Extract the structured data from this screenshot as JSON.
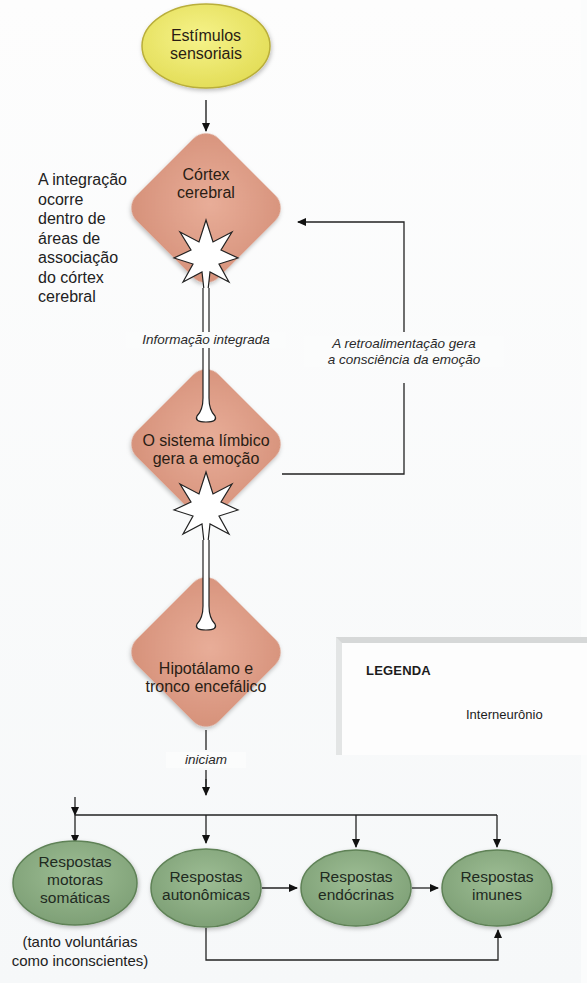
{
  "nodes": {
    "stimuli": {
      "label_line1": "Estímulos",
      "label_line2": "sensoriais",
      "color": "#ede96a"
    },
    "cortex": {
      "label_line1": "Córtex",
      "label_line2": "cerebral",
      "color": "#e1a18b"
    },
    "limbic": {
      "label_line1": "O sistema límbico",
      "label_line2": "gera a emoção",
      "color": "#e1a18b"
    },
    "hypothalamus": {
      "label_line1": "Hipotálamo e",
      "label_line2": "tronco encefálico",
      "color": "#e1a18b"
    },
    "somatic": {
      "label_line1": "Respostas",
      "label_line2": "motoras",
      "label_line3": "somáticas",
      "color": "#8eae86"
    },
    "autonomic": {
      "label_line1": "Respostas",
      "label_line2": "autonômicas",
      "color": "#8eae86"
    },
    "endocrine": {
      "label_line1": "Respostas",
      "label_line2": "endócrinas",
      "color": "#8eae86"
    },
    "immune": {
      "label_line1": "Respostas",
      "label_line2": "imunes",
      "color": "#8eae86"
    }
  },
  "annotations": {
    "integration_note": [
      "A integração",
      "ocorre",
      "dentro de",
      "áreas de",
      "associação",
      "do córtex",
      "cerebral"
    ],
    "integrated_info": "Informação integrada",
    "feedback_line1": "A retroalimentação gera",
    "feedback_line2": "a consciência da emoção",
    "initiate": "iniciam",
    "somatic_note_line1": "(tanto voluntárias",
    "somatic_note_line2": "como inconscientes)"
  },
  "legend": {
    "title": "LEGENDA",
    "items": [
      {
        "icon": "interneuron-icon",
        "label": "Interneurônio"
      }
    ]
  }
}
